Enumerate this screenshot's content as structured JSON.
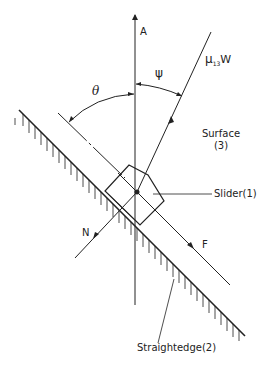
{
  "figure": {
    "type": "force-diagram",
    "labels": {
      "axis_a": "A",
      "friction_force": "μ₁₃W",
      "friction_mu": "μ",
      "friction_sub": "13",
      "friction_w": "W",
      "angle_psi": "ψ",
      "angle_theta": "θ",
      "surface": "Surface",
      "surface_num": "(3)",
      "slider": "Slider(1)",
      "normal": "N",
      "force_f": "F",
      "straightedge": "Straightedge(2)"
    },
    "colors": {
      "ink": "#222222",
      "background": "#ffffff"
    }
  }
}
